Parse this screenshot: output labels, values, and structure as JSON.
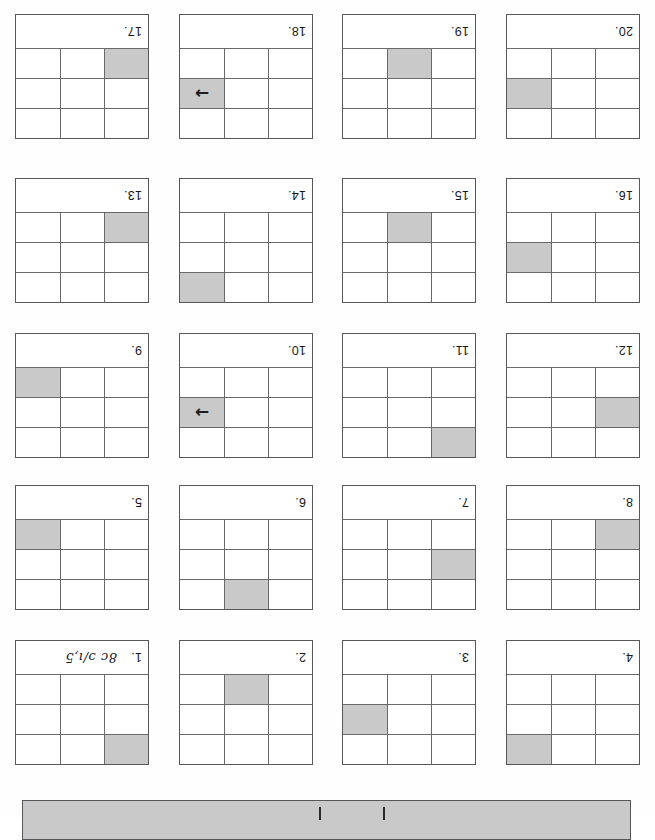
{
  "page": {
    "kind": "scanned-worksheet",
    "orientation": "upside-down",
    "rows": 5,
    "columns": 4,
    "total_boxes": 20,
    "grid_size": "3x3",
    "shade_color": "#c9c9c9",
    "line_color": "#6a6a6c",
    "border_color": "#58585a",
    "ink_color": "#17171a"
  },
  "arrow_glyph": "→",
  "footer": {
    "name": "footer-bar",
    "fill": "#c9c9c9",
    "ticks": 2
  },
  "boxes": [
    {
      "number": "17.",
      "note": "",
      "shaded_row": 3,
      "shaded_col": 1,
      "arrow": false
    },
    {
      "number": "18.",
      "note": "",
      "shaded_row": 2,
      "shaded_col": 3,
      "arrow": true
    },
    {
      "number": "19.",
      "note": "",
      "shaded_row": 3,
      "shaded_col": 2,
      "arrow": false
    },
    {
      "number": "20.",
      "note": "",
      "shaded_row": 2,
      "shaded_col": 3,
      "arrow": false
    },
    {
      "number": "13.",
      "note": "",
      "shaded_row": 3,
      "shaded_col": 1,
      "arrow": false
    },
    {
      "number": "14.",
      "note": "",
      "shaded_row": 1,
      "shaded_col": 3,
      "arrow": false
    },
    {
      "number": "15.",
      "note": "",
      "shaded_row": 3,
      "shaded_col": 2,
      "arrow": false
    },
    {
      "number": "16.",
      "note": "",
      "shaded_row": 2,
      "shaded_col": 3,
      "arrow": false
    },
    {
      "number": "9.",
      "note": "",
      "shaded_row": 3,
      "shaded_col": 3,
      "arrow": false
    },
    {
      "number": "10.",
      "note": "",
      "shaded_row": 2,
      "shaded_col": 3,
      "arrow": true
    },
    {
      "number": "11.",
      "note": "",
      "shaded_row": 1,
      "shaded_col": 1,
      "arrow": false
    },
    {
      "number": "12.",
      "note": "",
      "shaded_row": 2,
      "shaded_col": 1,
      "arrow": false
    },
    {
      "number": "5.",
      "note": "",
      "shaded_row": 3,
      "shaded_col": 3,
      "arrow": false
    },
    {
      "number": "6.",
      "note": "",
      "shaded_row": 1,
      "shaded_col": 2,
      "arrow": false
    },
    {
      "number": "7.",
      "note": "",
      "shaded_row": 2,
      "shaded_col": 1,
      "arrow": false
    },
    {
      "number": "8.",
      "note": "",
      "shaded_row": 3,
      "shaded_col": 1,
      "arrow": false
    },
    {
      "number": "1.",
      "note": "8c ɔ/ı,5",
      "shaded_row": 1,
      "shaded_col": 1,
      "arrow": false
    },
    {
      "number": "2.",
      "note": "",
      "shaded_row": 3,
      "shaded_col": 2,
      "arrow": false
    },
    {
      "number": "3.",
      "note": "",
      "shaded_row": 2,
      "shaded_col": 3,
      "arrow": false
    },
    {
      "number": "4.",
      "note": "",
      "shaded_row": 1,
      "shaded_col": 3,
      "arrow": false
    }
  ]
}
